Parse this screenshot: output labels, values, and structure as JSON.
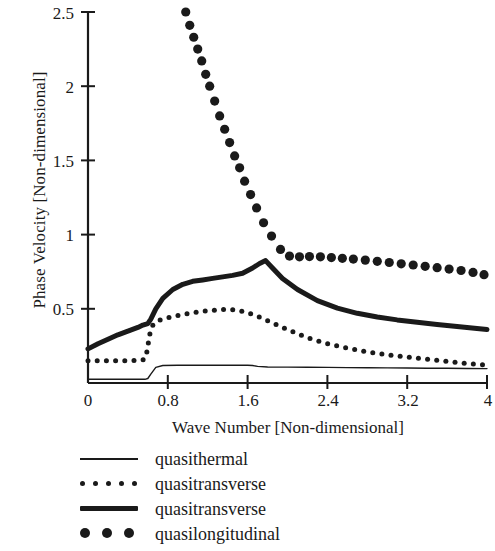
{
  "chart_data": {
    "type": "line",
    "title": "",
    "xlabel": "Wave Number [Non-dimensional]",
    "ylabel": "Phase Velocity [Non-dimensional]",
    "xlim": [
      0,
      4
    ],
    "ylim": [
      0,
      2.5
    ],
    "xticks": [
      "0",
      "0.8",
      "1.6",
      "2.4",
      "3.2",
      "4"
    ],
    "xtick_values": [
      0,
      0.8,
      1.6,
      2.4,
      3.2,
      4
    ],
    "yticks": [
      "0.5",
      "1",
      "1.5",
      "2",
      "2.5"
    ],
    "ytick_values": [
      0.5,
      1,
      1.5,
      2,
      2.5
    ],
    "grid": false,
    "legend_position": "below-axes",
    "series": [
      {
        "name": "quasithermal",
        "style": "thin-solid",
        "color": "#1a1a1a",
        "x": [
          0.0,
          0.1,
          0.2,
          0.3,
          0.4,
          0.5,
          0.57,
          0.6,
          0.63,
          0.68,
          0.75,
          0.9,
          1.1,
          1.3,
          1.5,
          1.6,
          1.65,
          1.7,
          1.8,
          2.0,
          2.2,
          2.4,
          2.6,
          2.8,
          3.0,
          3.2,
          3.4,
          3.6,
          3.8,
          4.0
        ],
        "y": [
          0.025,
          0.025,
          0.025,
          0.025,
          0.025,
          0.025,
          0.025,
          0.03,
          0.06,
          0.105,
          0.118,
          0.12,
          0.12,
          0.12,
          0.12,
          0.12,
          0.118,
          0.112,
          0.108,
          0.107,
          0.106,
          0.105,
          0.104,
          0.103,
          0.102,
          0.101,
          0.1,
          0.099,
          0.098,
          0.097
        ]
      },
      {
        "name": "quasitransverse",
        "style": "small-dotted",
        "color": "#1a1a1a",
        "x": [
          0.0,
          0.1,
          0.2,
          0.3,
          0.4,
          0.5,
          0.55,
          0.58,
          0.6,
          0.62,
          0.65,
          0.7,
          0.8,
          0.9,
          1.0,
          1.1,
          1.2,
          1.3,
          1.4,
          1.5,
          1.6,
          1.7,
          1.8,
          1.9,
          2.0,
          2.2,
          2.4,
          2.6,
          2.8,
          3.0,
          3.2,
          3.4,
          3.6,
          3.8,
          4.0
        ],
        "y": [
          0.15,
          0.15,
          0.15,
          0.15,
          0.15,
          0.152,
          0.155,
          0.17,
          0.25,
          0.33,
          0.39,
          0.42,
          0.44,
          0.455,
          0.468,
          0.478,
          0.487,
          0.493,
          0.496,
          0.49,
          0.475,
          0.45,
          0.42,
          0.39,
          0.36,
          0.305,
          0.265,
          0.235,
          0.21,
          0.19,
          0.175,
          0.16,
          0.145,
          0.132,
          0.12
        ]
      },
      {
        "name": "quasitransverse",
        "style": "thick-solid",
        "color": "#1a1a1a",
        "x": [
          0.0,
          0.1,
          0.2,
          0.3,
          0.4,
          0.5,
          0.55,
          0.6,
          0.63,
          0.68,
          0.75,
          0.85,
          0.95,
          1.05,
          1.15,
          1.25,
          1.35,
          1.45,
          1.55,
          1.65,
          1.72,
          1.78,
          1.85,
          1.95,
          2.1,
          2.3,
          2.5,
          2.7,
          2.9,
          3.1,
          3.3,
          3.5,
          3.7,
          3.85,
          4.0
        ],
        "y": [
          0.23,
          0.265,
          0.295,
          0.325,
          0.35,
          0.375,
          0.39,
          0.4,
          0.43,
          0.5,
          0.57,
          0.63,
          0.665,
          0.685,
          0.695,
          0.705,
          0.715,
          0.725,
          0.74,
          0.775,
          0.805,
          0.825,
          0.775,
          0.705,
          0.63,
          0.555,
          0.505,
          0.47,
          0.445,
          0.425,
          0.41,
          0.395,
          0.38,
          0.37,
          0.36
        ]
      },
      {
        "name": "quasilongitudinal",
        "style": "large-dotted",
        "color": "#1a1a1a",
        "x": [
          0.98,
          1.02,
          1.06,
          1.1,
          1.14,
          1.18,
          1.22,
          1.27,
          1.32,
          1.37,
          1.42,
          1.47,
          1.52,
          1.57,
          1.63,
          1.69,
          1.76,
          1.84,
          1.93,
          2.02,
          2.12,
          2.22,
          2.33,
          2.44,
          2.55,
          2.66,
          2.78,
          2.9,
          3.02,
          3.14,
          3.26,
          3.38,
          3.5,
          3.62,
          3.74,
          3.86,
          3.97
        ],
        "y": [
          2.5,
          2.41,
          2.33,
          2.25,
          2.17,
          2.08,
          2.0,
          1.9,
          1.8,
          1.71,
          1.62,
          1.53,
          1.45,
          1.36,
          1.27,
          1.18,
          1.08,
          0.99,
          0.9,
          0.855,
          0.85,
          0.852,
          0.85,
          0.845,
          0.84,
          0.835,
          0.828,
          0.82,
          0.812,
          0.803,
          0.795,
          0.786,
          0.777,
          0.768,
          0.758,
          0.745,
          0.73
        ]
      }
    ]
  },
  "axes": {
    "ylabel": "Phase Velocity [Non-dimensional]",
    "xlabel": "Wave Number [Non-dimensional]",
    "ytick_0": "2.5",
    "ytick_1": "2",
    "ytick_2": "1.5",
    "ytick_3": "1",
    "ytick_4": "0.5",
    "xtick_0": "0",
    "xtick_1": "0.8",
    "xtick_2": "1.6",
    "xtick_3": "2.4",
    "xtick_4": "3.2",
    "xtick_5": "4"
  },
  "legend": {
    "items": [
      {
        "label": "quasithermal",
        "style": "thin-solid"
      },
      {
        "label": "quasitransverse",
        "style": "small-dotted"
      },
      {
        "label": "quasitransverse",
        "style": "thick-solid"
      },
      {
        "label": "quasilongitudinal",
        "style": "large-dotted"
      }
    ]
  }
}
